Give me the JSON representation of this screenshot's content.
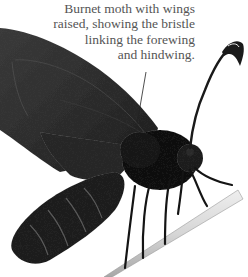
{
  "caption": {
    "lines": [
      "Burnet moth with wings",
      "raised, showing the bristle",
      "linking the forewing",
      "and hindwing."
    ],
    "color": "#555555"
  },
  "photo": {
    "subject": "burnet moth on plant stem",
    "colors": {
      "wing": "#2e2e2e",
      "body": "#111111",
      "stem": "#d8d8d8",
      "background": "#ffffff"
    }
  }
}
